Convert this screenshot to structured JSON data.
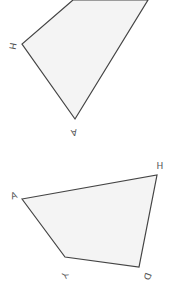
{
  "colors": {
    "fill": "#f4f4f4",
    "stroke": "#444444",
    "label": "#555555"
  },
  "shapes": [
    {
      "name": "top-quadrilateral",
      "points": "73,0 22,44 75,119 148,0",
      "labels": [
        {
          "text": "H",
          "x": 12,
          "y": 46,
          "rotate": 100
        },
        {
          "text": "A",
          "x": 74,
          "y": 132,
          "rotate": 170
        }
      ]
    },
    {
      "name": "bottom-quadrilateral",
      "points": "22,199 157,175 139,267 65,257",
      "labels": [
        {
          "text": "A",
          "x": 14,
          "y": 196,
          "rotate": -20
        },
        {
          "text": "H",
          "x": 160,
          "y": 166,
          "rotate": 0
        },
        {
          "text": "Y",
          "x": 64,
          "y": 275,
          "rotate": 120
        },
        {
          "text": "D",
          "x": 147,
          "y": 276,
          "rotate": 110
        }
      ]
    }
  ]
}
